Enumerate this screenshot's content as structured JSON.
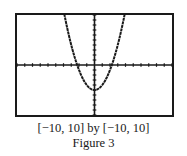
{
  "chart_data": {
    "type": "line",
    "title": "Figure 3",
    "window_label": "[−10, 10] by [−10, 10]",
    "xlim": [
      -10,
      10
    ],
    "ylim": [
      -10,
      10
    ],
    "xscale": 1,
    "yscale": 1,
    "grid": false,
    "axes": true,
    "series": [
      {
        "name": "parabola",
        "equation": "y = x^2 - 5",
        "x": [
          -3.87,
          -3,
          -2.24,
          -2,
          -1,
          0,
          1,
          2,
          2.24,
          3,
          3.87
        ],
        "y": [
          10,
          4,
          0,
          -1,
          -4,
          -5,
          -4,
          -1,
          0,
          4,
          10
        ]
      }
    ],
    "colors": {
      "frame": "#1a1a1a",
      "curve": "#1a1a1a",
      "background": "#ffffff"
    }
  },
  "caption": {
    "window": "[−10, 10] by [−10, 10]",
    "figure": "Figure 3"
  }
}
